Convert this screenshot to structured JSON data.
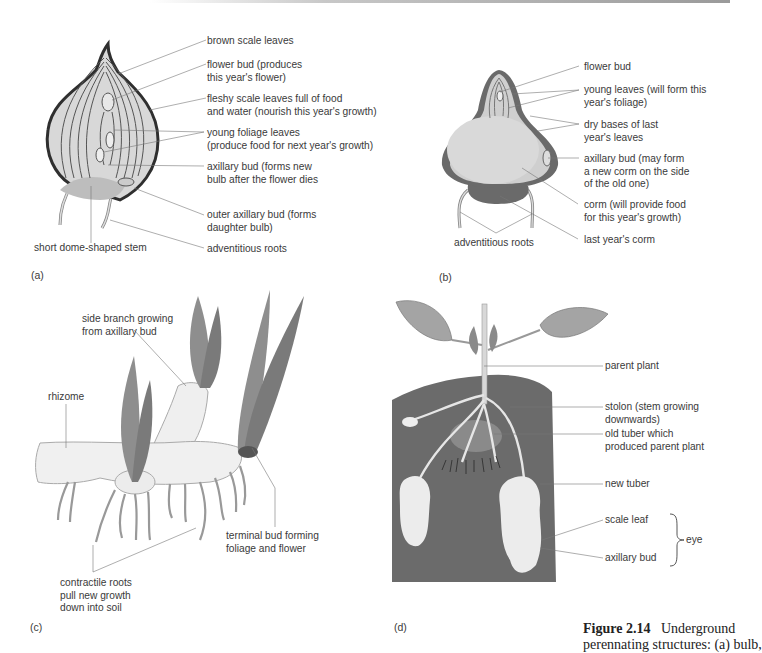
{
  "panels": {
    "a": {
      "id_label": "(a)",
      "title": "bulb",
      "labels": {
        "brown_scale_leaves": "brown scale leaves",
        "flower_bud": "flower bud (produces\nthis year's flower)",
        "fleshy_scale_leaves": "fleshy scale leaves full of food\nand water (nourish this year's growth)",
        "young_foliage_leaves": "young foliage leaves\n(produce food for next year's growth)",
        "axillary_bud": "axillary bud (forms new\nbulb after the flower dies",
        "outer_axillary_bud": "outer axillary bud (forms\ndaughter bulb)",
        "adventitious_roots": "adventitious roots",
        "stem": "short dome-shaped stem"
      }
    },
    "b": {
      "id_label": "(b)",
      "title": "corm",
      "labels": {
        "flower_bud": "flower bud",
        "young_leaves": "young leaves (will form this\nyear's foliage)",
        "dry_bases": "dry bases of last\nyear's leaves",
        "axillary_bud": "axillary bud (may form\na new corm on the side\nof the old one)",
        "corm": "corm (will provide food\nfor this year's growth)",
        "last_years_corm": "last year's corm",
        "adventitious_roots": "adventitious roots"
      }
    },
    "c": {
      "id_label": "(c)",
      "title": "rhizome",
      "labels": {
        "side_branch": "side branch growing\nfrom axillary bud",
        "rhizome": "rhizome",
        "terminal_bud": "terminal bud forming\nfoliage and flower",
        "contractile_roots": "contractile roots\npull new growth\ndown into soil"
      }
    },
    "d": {
      "id_label": "(d)",
      "title": "stem tuber",
      "labels": {
        "parent_plant": "parent plant",
        "stolon": "stolon (stem growing\ndownwards)",
        "old_tuber": "old tuber which\nproduced parent plant",
        "new_tuber": "new tuber",
        "scale_leaf": "scale leaf",
        "axillary_bud": "axillary bud",
        "eye": "eye"
      }
    }
  },
  "caption": {
    "figure_number": "Figure 2.14",
    "text_line1": "Underground",
    "text_line2": "perennating structures: (a) bulb,"
  },
  "colors": {
    "ink": "#3a3a3a",
    "soil": "#6e6e6e",
    "leaf": "#9a9a9a",
    "tissue": "#d6d6d6",
    "outline": "#333333"
  }
}
